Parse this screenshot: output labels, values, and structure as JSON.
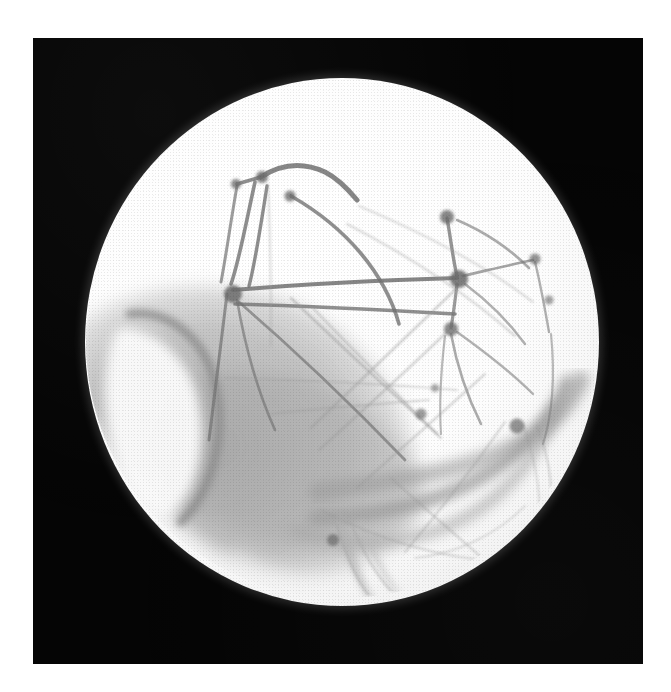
{
  "page": {
    "background_color": "#ffffff",
    "plate": {
      "label": "photographic plate",
      "background_color": "#050505",
      "left": 33,
      "top": 38,
      "width": 610,
      "height": 626
    },
    "caption": {
      "text": "",
      "visible_fragment": ""
    }
  },
  "figure": {
    "style": "pencil / ink astronomical sketch reproduced on black plate",
    "disk": {
      "label": "planetary disk",
      "center_x": 341,
      "center_y": 341,
      "radius": 257,
      "fill_color": "#ffffff",
      "limb_color": "#d8d8d8"
    },
    "albedo_regions": [
      {
        "name": "dark-maria-southwest",
        "tone": "#9d9d9d",
        "description": "large dusky region sweeping from the west limb across the lower centre"
      },
      {
        "name": "bright-bay-west",
        "tone": "#fafafa",
        "description": "bright bay enclosed by a dark crescent arc near the west limb"
      },
      {
        "name": "dark-band-southeast",
        "tone": "#a6a6a6",
        "description": "curved dark band running to the southeast limb"
      },
      {
        "name": "dark-streak-south",
        "tone": "#b4b4b4",
        "description": "short tapering streak descending toward the south limb"
      }
    ],
    "canal_network": {
      "line_color": "#8c8c8c",
      "node_color": "#6e6e6e",
      "nodes": [
        {
          "name": "oasis-north",
          "x": 295,
          "y": 125,
          "size": 9
        },
        {
          "name": "oasis-north-west",
          "x": 262,
          "y": 137,
          "size": 7
        },
        {
          "name": "oasis-north-east",
          "x": 320,
          "y": 148,
          "size": 8
        },
        {
          "name": "oasis-hub-west",
          "x": 262,
          "y": 238,
          "size": 13
        },
        {
          "name": "oasis-upper-east",
          "x": 480,
          "y": 176,
          "size": 10
        },
        {
          "name": "oasis-limb-east",
          "x": 534,
          "y": 218,
          "size": 8
        },
        {
          "name": "oasis-hub-east",
          "x": 487,
          "y": 236,
          "size": 13
        },
        {
          "name": "oasis-east-lower",
          "x": 545,
          "y": 258,
          "size": 7
        },
        {
          "name": "oasis-mid-east",
          "x": 483,
          "y": 285,
          "size": 10
        },
        {
          "name": "oasis-centre-small",
          "x": 437,
          "y": 344,
          "size": 6
        },
        {
          "name": "oasis-centre",
          "x": 424,
          "y": 370,
          "size": 8
        },
        {
          "name": "oasis-southeast",
          "x": 518,
          "y": 381,
          "size": 10
        },
        {
          "name": "oasis-south",
          "x": 324,
          "y": 522,
          "size": 8
        }
      ],
      "canal_count": 27
    }
  }
}
